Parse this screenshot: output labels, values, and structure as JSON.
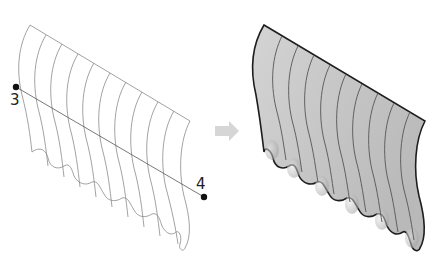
{
  "figure": {
    "top_caption_cropped": "",
    "left_panel": {
      "name": "wireframe-sections",
      "point_start": {
        "label": "3",
        "x": 16,
        "y": 87
      },
      "point_end": {
        "label": "4",
        "x": 204,
        "y": 197
      },
      "section_curve_count": 10,
      "stroke_color": "#8a8a8a"
    },
    "arrow": {
      "direction": "right",
      "color": "#d6d6d6"
    },
    "right_panel": {
      "name": "shaded-lofted-surface",
      "fill_color": "#c9c9c9",
      "outline_color": "#1e1e1e",
      "section_line_color": "#555555"
    }
  }
}
